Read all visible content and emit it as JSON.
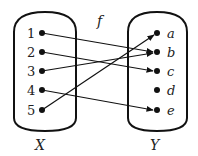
{
  "function_label": "f",
  "domain": {
    "label": "X",
    "elements": [
      "1",
      "2",
      "3",
      "4",
      "5"
    ]
  },
  "codomain": {
    "label": "Y",
    "elements": [
      "a",
      "b",
      "c",
      "d",
      "e"
    ]
  },
  "mapping": [
    {
      "from": "1",
      "to": "b"
    },
    {
      "from": "2",
      "to": "c"
    },
    {
      "from": "3",
      "to": "b"
    },
    {
      "from": "4",
      "to": "e"
    },
    {
      "from": "5",
      "to": "a"
    }
  ]
}
